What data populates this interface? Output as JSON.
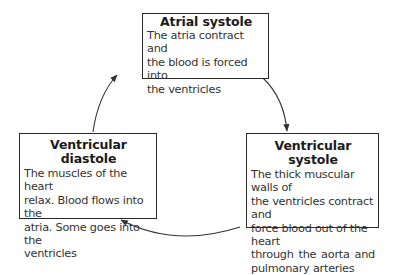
{
  "diagram": {
    "type": "cycle",
    "nodes": [
      {
        "id": "atrial-systole",
        "title": "Atrial systole",
        "description": "The atria contract and the blood is forced into the ventricles",
        "lines": [
          "The atria contract and",
          "the blood is forced into",
          "the ventricles"
        ]
      },
      {
        "id": "ventricular-systole",
        "title": "Ventricular systole",
        "description": "The thick muscular walls of the ventricles contract and force blood out of the heart through the aorta and pulmonary arteries",
        "lines": [
          "The thick muscular walls of",
          "the ventricles contract and",
          "force blood out of the heart",
          "through the aorta and",
          "pulmonary arteries"
        ]
      },
      {
        "id": "ventricular-diastole",
        "title": "Ventricular diastole",
        "description": "The muscles of the heart relax. Blood flows into the atria. Some goes into the ventricles",
        "lines": [
          "The muscles of the heart",
          "relax. Blood flows into the",
          "atria. Some goes into the",
          "ventricles"
        ]
      }
    ],
    "edges": [
      {
        "from": "atrial-systole",
        "to": "ventricular-systole"
      },
      {
        "from": "ventricular-systole",
        "to": "ventricular-diastole"
      },
      {
        "from": "ventricular-diastole",
        "to": "atrial-systole"
      }
    ],
    "colors": {
      "border": "#2a2a2a",
      "title_text": "#1a1a1a",
      "body_text": "#333333",
      "arrow": "#333333",
      "background": "#ffffff"
    }
  }
}
